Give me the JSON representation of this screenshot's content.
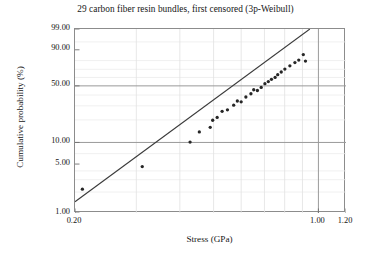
{
  "chart_data": {
    "type": "scatter",
    "title": "29 carbon fiber resin bundles, first censored (3p-Weibull)",
    "xlabel": "Stress (GPa)",
    "ylabel": "Cumulative probability (%)",
    "xscale": "log",
    "yscale": "weibull",
    "xlim": [
      0.2,
      1.2
    ],
    "ylim": [
      1.0,
      99.0
    ],
    "grid": true,
    "legend": null,
    "xticks": [
      {
        "value": 0.2,
        "label": "0.20"
      },
      {
        "value": 1.0,
        "label": "1.00"
      },
      {
        "value": 1.2,
        "label": "1.20"
      }
    ],
    "xgridlines": [
      0.3,
      0.4,
      0.5,
      0.6,
      0.7,
      0.8,
      0.9,
      1.0
    ],
    "yticks": [
      {
        "value": 99.0,
        "label": "99.00"
      },
      {
        "value": 90.0,
        "label": "90.00"
      },
      {
        "value": 50.0,
        "label": "50.00"
      },
      {
        "value": 10.0,
        "label": "10.00"
      },
      {
        "value": 5.0,
        "label": "5.00"
      },
      {
        "value": 1.0,
        "label": "1.00"
      }
    ],
    "ygridlines_major": [
      50.0,
      10.0
    ],
    "ygridlines_minor": [
      95.0,
      80.0,
      70.0,
      60.0,
      40.0,
      30.0,
      20.0,
      7.0,
      4.0,
      3.0,
      2.0
    ],
    "series": [
      {
        "name": "data points",
        "type": "scatter",
        "marker": "circle",
        "color": "#262626",
        "points": [
          {
            "x": 0.21,
            "y": 2.2
          },
          {
            "x": 0.312,
            "y": 4.6
          },
          {
            "x": 0.428,
            "y": 10.1
          },
          {
            "x": 0.455,
            "y": 13.9
          },
          {
            "x": 0.489,
            "y": 16.0
          },
          {
            "x": 0.497,
            "y": 19.8
          },
          {
            "x": 0.512,
            "y": 21.5
          },
          {
            "x": 0.529,
            "y": 25.7
          },
          {
            "x": 0.548,
            "y": 26.8
          },
          {
            "x": 0.571,
            "y": 30.5
          },
          {
            "x": 0.585,
            "y": 34.2
          },
          {
            "x": 0.6,
            "y": 33.5
          },
          {
            "x": 0.619,
            "y": 38.0
          },
          {
            "x": 0.64,
            "y": 41.3
          },
          {
            "x": 0.652,
            "y": 45.6
          },
          {
            "x": 0.668,
            "y": 44.8
          },
          {
            "x": 0.685,
            "y": 48.2
          },
          {
            "x": 0.702,
            "y": 52.5
          },
          {
            "x": 0.718,
            "y": 55.0
          },
          {
            "x": 0.733,
            "y": 57.8
          },
          {
            "x": 0.751,
            "y": 60.1
          },
          {
            "x": 0.764,
            "y": 63.4
          },
          {
            "x": 0.782,
            "y": 66.7
          },
          {
            "x": 0.801,
            "y": 70.2
          },
          {
            "x": 0.828,
            "y": 74.1
          },
          {
            "x": 0.856,
            "y": 77.8
          },
          {
            "x": 0.878,
            "y": 80.5
          },
          {
            "x": 0.905,
            "y": 86.0
          },
          {
            "x": 0.918,
            "y": 79.5
          }
        ]
      },
      {
        "name": "fitted line",
        "type": "line",
        "color": "#3a3a3a",
        "endpoints": [
          {
            "x": 0.2,
            "y": 1.45
          },
          {
            "x": 0.945,
            "y": 99.0
          }
        ]
      }
    ]
  }
}
